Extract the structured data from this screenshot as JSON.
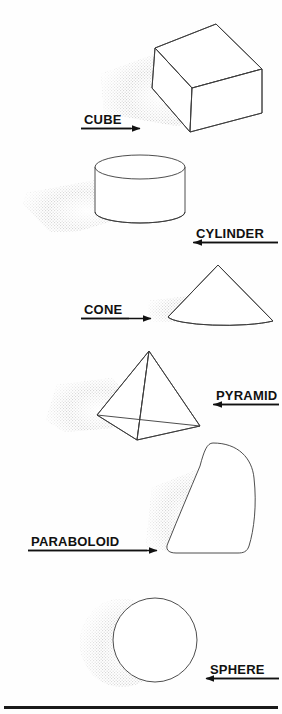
{
  "figure": {
    "background_color": "#fefefe",
    "outline_color": "#3a3a3a",
    "text_color": "#111111",
    "shadow_color": "#c9c9c9",
    "bottom_rule": {
      "present": true,
      "color": "#1a1a1a",
      "y": 706,
      "x": 4,
      "width": 274,
      "height": 3
    }
  },
  "solids": [
    {
      "id": "cube",
      "label": "CUBE",
      "shape": "cube",
      "label_x": 84,
      "label_y": 124,
      "underline": {
        "x1": 81,
        "x2": 131,
        "y": 128
      },
      "arrow": {
        "direction": "right",
        "x1": 81,
        "x2": 148,
        "y": 128
      },
      "shadow": "dithered-gray",
      "bounds": {
        "x": 138,
        "y": 18,
        "width": 124,
        "height": 115
      }
    },
    {
      "id": "cylinder",
      "label": "CYLINDER",
      "shape": "cylinder",
      "label_x": 196,
      "label_y": 238,
      "underline": {
        "x1": 193,
        "x2": 278,
        "y": 242
      },
      "arrow": {
        "direction": "left",
        "x1": 278,
        "x2": 186,
        "y": 242
      },
      "shadow": "dithered-gray",
      "bounds": {
        "x": 95,
        "y": 153,
        "width": 92,
        "height": 72
      }
    },
    {
      "id": "cone",
      "label": "CONE",
      "shape": "cone",
      "label_x": 84,
      "label_y": 314,
      "underline": {
        "x1": 81,
        "x2": 129,
        "y": 318
      },
      "arrow": {
        "direction": "right",
        "x1": 81,
        "x2": 159,
        "y": 318
      },
      "shadow": "dithered-gray",
      "bounds": {
        "x": 167,
        "y": 264,
        "width": 108,
        "height": 68
      }
    },
    {
      "id": "pyramid",
      "label": "PYRAMID",
      "shape": "pyramid",
      "label_x": 216,
      "label_y": 400,
      "underline": {
        "x1": 213,
        "x2": 279,
        "y": 404
      },
      "arrow": {
        "direction": "left",
        "x1": 279,
        "x2": 206,
        "y": 404
      },
      "shadow": "dithered-gray",
      "bounds": {
        "x": 97,
        "y": 351,
        "width": 103,
        "height": 90
      }
    },
    {
      "id": "paraboloid",
      "label": "PARABOLOID",
      "shape": "paraboloid",
      "label_x": 31,
      "label_y": 546,
      "underline": {
        "x1": 28,
        "x2": 147,
        "y": 550
      },
      "arrow": {
        "direction": "right",
        "x1": 28,
        "x2": 165,
        "y": 550
      },
      "shadow": "dithered-gray",
      "bounds": {
        "x": 158,
        "y": 443,
        "width": 98,
        "height": 110
      }
    },
    {
      "id": "sphere",
      "label": "SPHERE",
      "shape": "sphere",
      "label_x": 210,
      "label_y": 674,
      "underline": {
        "x1": 207,
        "x2": 279,
        "y": 678
      },
      "arrow": {
        "direction": "left",
        "x1": 279,
        "x2": 198,
        "y": 678
      },
      "shadow": "dithered-gray",
      "bounds": {
        "x": 113,
        "y": 598,
        "width": 84,
        "height": 85
      }
    }
  ]
}
